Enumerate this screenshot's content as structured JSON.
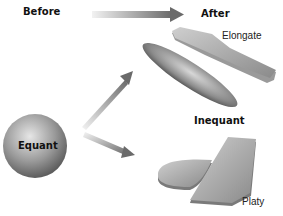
{
  "labels": {
    "before": "Before",
    "after": "After",
    "equant": "Equant",
    "inequant": "Inequant",
    "elongate": "Elongate",
    "platy": "Platy"
  },
  "colors": {
    "arrow_dark": "#5a5a5a",
    "arrow_light": "#e8e8e8",
    "shape_light": "#c8c8c8",
    "shape_dark": "#6a6a6a"
  }
}
